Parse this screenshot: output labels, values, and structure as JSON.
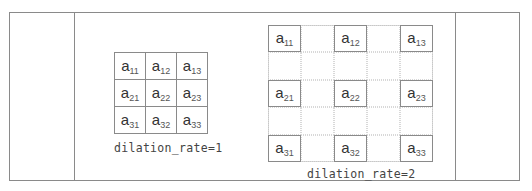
{
  "diagram": {
    "left_grid": {
      "label": "dilation_rate=1",
      "rows": [
        [
          {
            "base": "a",
            "sub": "11"
          },
          {
            "base": "a",
            "sub": "12"
          },
          {
            "base": "a",
            "sub": "13"
          }
        ],
        [
          {
            "base": "a",
            "sub": "21"
          },
          {
            "base": "a",
            "sub": "22"
          },
          {
            "base": "a",
            "sub": "23"
          }
        ],
        [
          {
            "base": "a",
            "sub": "31"
          },
          {
            "base": "a",
            "sub": "32"
          },
          {
            "base": "a",
            "sub": "33"
          }
        ]
      ]
    },
    "right_grid": {
      "label": "dilation_rate=2",
      "size": 5,
      "cells": [
        {
          "row": 0,
          "col": 0,
          "base": "a",
          "sub": "11"
        },
        {
          "row": 0,
          "col": 2,
          "base": "a",
          "sub": "12"
        },
        {
          "row": 0,
          "col": 4,
          "base": "a",
          "sub": "13"
        },
        {
          "row": 2,
          "col": 0,
          "base": "a",
          "sub": "21"
        },
        {
          "row": 2,
          "col": 2,
          "base": "a",
          "sub": "22"
        },
        {
          "row": 2,
          "col": 4,
          "base": "a",
          "sub": "23"
        },
        {
          "row": 4,
          "col": 0,
          "base": "a",
          "sub": "31"
        },
        {
          "row": 4,
          "col": 2,
          "base": "a",
          "sub": "32"
        },
        {
          "row": 4,
          "col": 4,
          "base": "a",
          "sub": "33"
        }
      ]
    }
  }
}
